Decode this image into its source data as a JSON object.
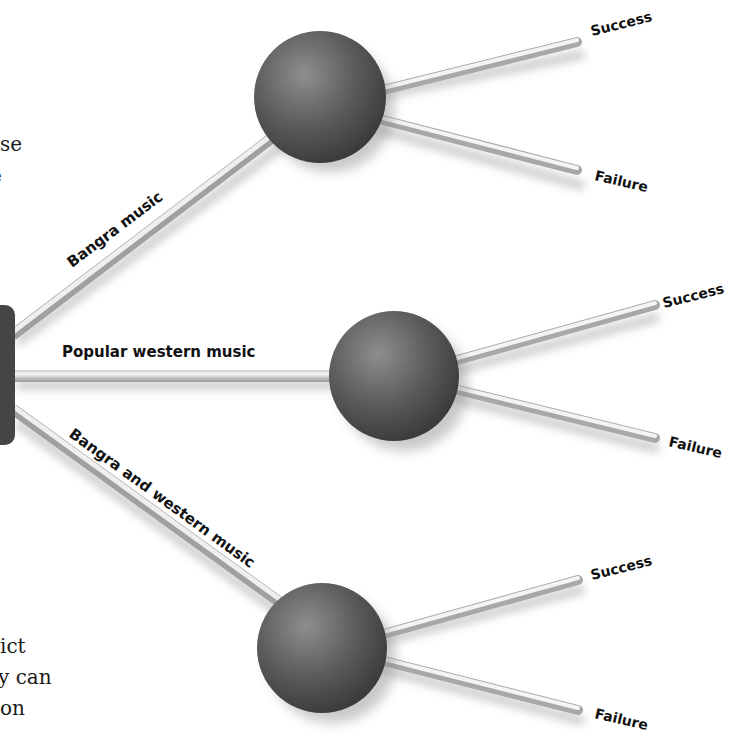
{
  "text_fragments": {
    "left_top_1": "se",
    "left_top_2": "e",
    "left_bottom_1": "ict",
    "left_bottom_2": "y can",
    "left_bottom_3": "on"
  },
  "tree": {
    "root": {
      "shape": "rounded-rectangle",
      "color": "#444444"
    },
    "branches": [
      {
        "label": "Bangra music",
        "node": {
          "shape": "sphere"
        },
        "outcomes": [
          "Success",
          "Failure"
        ]
      },
      {
        "label": "Popular western music",
        "node": {
          "shape": "sphere"
        },
        "outcomes": [
          "Success",
          "Failure"
        ]
      },
      {
        "label": "Bangra and western music",
        "node": {
          "shape": "sphere"
        },
        "outcomes": [
          "Success",
          "Failure"
        ]
      }
    ]
  },
  "colors": {
    "sphere_dark": "#3e3e3e",
    "sphere_light": "#8a8a8a",
    "rod_light": "#f2f2f2",
    "rod_dark": "#a8a8a8",
    "text": "#111111"
  }
}
